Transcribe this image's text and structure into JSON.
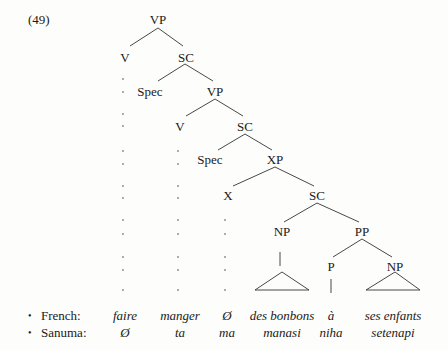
{
  "example_number": "(49)",
  "tree": {
    "nodes": {
      "vp_root": "VP",
      "v1": "V",
      "sc1": "SC",
      "spec1": "Spec",
      "vp2": "VP",
      "v2": "V",
      "sc2": "SC",
      "spec2": "Spec",
      "xp": "XP",
      "x": "X",
      "sc3": "SC",
      "np1": "NP",
      "pp": "PP",
      "p": "P",
      "np2": "NP"
    }
  },
  "glosses": {
    "french": {
      "label": "French:",
      "words": [
        "faire",
        "manger",
        "Ø",
        "des bonbons",
        "à",
        "ses enfants"
      ]
    },
    "sanuma": {
      "label": "Sanuma:",
      "words": [
        "Ø",
        "ta",
        "ma",
        "manasi",
        "niha",
        "setenapi"
      ]
    }
  },
  "bullet": "•"
}
